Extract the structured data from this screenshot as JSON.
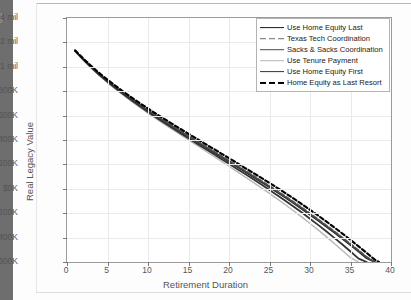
{
  "page_marker": "6-9",
  "chart_data": {
    "type": "line",
    "title": "",
    "xlabel": "Retirement Duration",
    "ylabel": "Real Legacy Value",
    "xlim": [
      0,
      40
    ],
    "ylim": [
      -600000,
      1400000
    ],
    "grid": true,
    "legend_position": "upper-right",
    "xticks": [
      0,
      5,
      10,
      15,
      20,
      25,
      30,
      35,
      40
    ],
    "xticklabels": [
      "0",
      "5",
      "10",
      "15",
      "20",
      "25",
      "30",
      "35",
      "40"
    ],
    "yticks": [
      1400000,
      1200000,
      1000000,
      800000,
      600000,
      400000,
      200000,
      0,
      -200000,
      -400000,
      -600000
    ],
    "yticklabels": [
      "$1.4 mil",
      "$1.2 mil",
      "$1 mil",
      "$800K",
      "$600K",
      "$400K",
      "$200K",
      "$0K",
      "-$200K",
      "-$400K",
      "-$600K"
    ],
    "x": [
      1,
      2,
      3,
      4,
      5,
      6,
      7,
      8,
      9,
      10,
      11,
      12,
      13,
      14,
      15,
      16,
      17,
      18,
      19,
      20,
      21,
      22,
      23,
      24,
      25,
      26,
      27,
      28,
      29,
      30,
      31,
      32,
      33,
      34,
      35,
      36,
      37,
      38,
      38.5
    ],
    "series": [
      {
        "name": "Use Home Equity Last",
        "color": "#1a1a1a",
        "style": "solid",
        "width": 1.8,
        "values": [
          1130000,
          1060000,
          995000,
          935000,
          880000,
          827000,
          777000,
          729000,
          683000,
          638000,
          594000,
          551000,
          509000,
          467000,
          426000,
          385000,
          344000,
          303000,
          262000,
          221000,
          180000,
          139000,
          97000,
          55000,
          13000,
          -30000,
          -74000,
          -119000,
          -165000,
          -212000,
          -260000,
          -309000,
          -359000,
          -410000,
          -462000,
          -515000,
          -569000,
          -600000,
          null
        ]
      },
      {
        "name": "Texas Tech Coordination",
        "color": "#6d6d6d",
        "style": "dashed",
        "width": 1.6,
        "values": [
          1132000,
          1064000,
          1000000,
          941000,
          886000,
          834000,
          784000,
          736000,
          690000,
          646000,
          602000,
          559000,
          517000,
          476000,
          435000,
          394000,
          354000,
          313000,
          273000,
          232000,
          191000,
          150000,
          109000,
          67000,
          25000,
          -18000,
          -62000,
          -107000,
          -153000,
          -200000,
          -248000,
          -297000,
          -347000,
          -398000,
          -450000,
          -503000,
          -557000,
          -600000,
          null
        ]
      },
      {
        "name": "Sacks & Sacks Coordination",
        "color": "#4a4a4a",
        "style": "solid",
        "width": 1.6,
        "values": [
          1131000,
          1062000,
          998000,
          938000,
          883000,
          831000,
          781000,
          733000,
          687000,
          642000,
          598000,
          555000,
          513000,
          472000,
          431000,
          390000,
          349000,
          308000,
          268000,
          227000,
          186000,
          145000,
          103000,
          61000,
          19000,
          -24000,
          -68000,
          -113000,
          -159000,
          -206000,
          -254000,
          -303000,
          -353000,
          -404000,
          -456000,
          -509000,
          -563000,
          -600000,
          null
        ]
      },
      {
        "name": "Use Tenure Payment",
        "color": "#b6b6b6",
        "style": "solid",
        "width": 1.4,
        "values": [
          1129000,
          1057000,
          990000,
          928000,
          871000,
          817000,
          765000,
          715000,
          667000,
          620000,
          575000,
          530000,
          486000,
          443000,
          400000,
          357000,
          314000,
          271000,
          228000,
          185000,
          141000,
          97000,
          53000,
          8000,
          -38000,
          -85000,
          -133000,
          -182000,
          -232000,
          -284000,
          -337000,
          -392000,
          -448000,
          -506000,
          -565000,
          -600000,
          null,
          null,
          null
        ]
      },
      {
        "name": "Use Home Equity First",
        "color": "#333333",
        "style": "solid",
        "width": 1.8,
        "values": [
          1130000,
          1059000,
          993000,
          932000,
          876000,
          823000,
          772000,
          723000,
          676000,
          630000,
          585000,
          541000,
          498000,
          456000,
          414000,
          372000,
          330000,
          289000,
          247000,
          205000,
          163000,
          121000,
          78000,
          35000,
          -9000,
          -54000,
          -100000,
          -147000,
          -195000,
          -245000,
          -296000,
          -348000,
          -402000,
          -457000,
          -514000,
          -572000,
          -600000,
          null,
          null
        ]
      },
      {
        "name": "Home Equity as Last Resort",
        "color": "#000000",
        "style": "dashed",
        "width": 2.1,
        "values": [
          1135000,
          1068000,
          1006000,
          948000,
          894000,
          843000,
          794000,
          747000,
          702000,
          658000,
          615000,
          573000,
          532000,
          491000,
          451000,
          411000,
          371000,
          331000,
          291000,
          251000,
          211000,
          170000,
          130000,
          89000,
          48000,
          6000,
          -37000,
          -81000,
          -126000,
          -172000,
          -219000,
          -267000,
          -317000,
          -367000,
          -419000,
          -472000,
          -526000,
          -581000,
          -600000
        ]
      }
    ]
  }
}
